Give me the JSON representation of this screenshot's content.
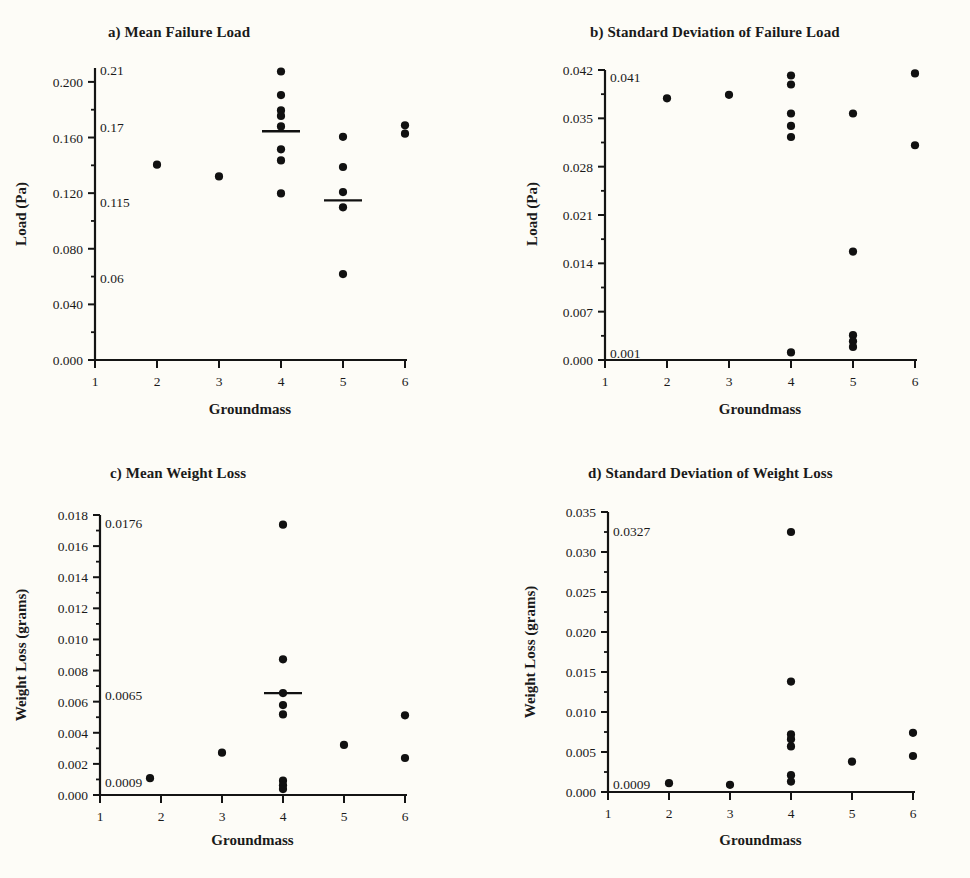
{
  "figure": {
    "background": "#fdfcf7",
    "ink": "#141414",
    "marker_color": "#111111"
  },
  "chart_data": [
    {
      "id": "panel-a",
      "type": "scatter",
      "title": "a) Mean Failure Load",
      "xlabel": "Groundmass",
      "ylabel": "Load (Pa)",
      "xlim": [
        1,
        6
      ],
      "ylim": [
        0.0,
        0.21
      ],
      "xticks": [
        1,
        2,
        3,
        4,
        5,
        6
      ],
      "xticklabels": [
        "1",
        "2",
        "3",
        "4",
        "5",
        "6"
      ],
      "yticks": [
        0.0,
        0.04,
        0.08,
        0.12,
        0.16,
        0.2
      ],
      "yticklabels": [
        "0.000",
        "0.040",
        "0.080",
        "0.120",
        "0.160",
        "0.200"
      ],
      "minor_yticks": [
        0.02,
        0.06,
        0.1,
        0.14,
        0.18
      ],
      "grid": false,
      "legend": "none",
      "annotations": [
        {
          "text": "0.21",
          "y": 0.2095
        },
        {
          "text": "0.17",
          "y": 0.168
        },
        {
          "text": "0.115",
          "y": 0.1145
        },
        {
          "text": "0.06",
          "y": 0.0595
        }
      ],
      "points": [
        {
          "x": 2,
          "y": 0.1405
        },
        {
          "x": 3,
          "y": 0.132
        },
        {
          "x": 4,
          "y": 0.2075
        },
        {
          "x": 4,
          "y": 0.1905
        },
        {
          "x": 4,
          "y": 0.1795
        },
        {
          "x": 4,
          "y": 0.1755
        },
        {
          "x": 4,
          "y": 0.168
        },
        {
          "x": 4,
          "y": 0.1515
        },
        {
          "x": 4,
          "y": 0.1435
        },
        {
          "x": 4,
          "y": 0.1198
        },
        {
          "x": 5,
          "y": 0.1605
        },
        {
          "x": 5,
          "y": 0.1388
        },
        {
          "x": 5,
          "y": 0.1208
        },
        {
          "x": 5,
          "y": 0.1098
        },
        {
          "x": 5,
          "y": 0.0618
        },
        {
          "x": 6,
          "y": 0.1688
        },
        {
          "x": 6,
          "y": 0.1628
        }
      ],
      "mean_lines": [
        {
          "x": 4,
          "y": 0.1645
        },
        {
          "x": 5,
          "y": 0.1148
        }
      ]
    },
    {
      "id": "panel-b",
      "type": "scatter",
      "title": "b) Standard Deviation of Failure Load",
      "xlabel": "Groundmass",
      "ylabel": "Load (Pa)",
      "xlim": [
        1,
        6
      ],
      "ylim": [
        0.0,
        0.042
      ],
      "xticks": [
        1,
        2,
        3,
        4,
        5,
        6
      ],
      "xticklabels": [
        "1",
        "2",
        "3",
        "4",
        "5",
        "6"
      ],
      "yticks": [
        0.0,
        0.007,
        0.014,
        0.021,
        0.028,
        0.035,
        0.042
      ],
      "yticklabels": [
        "0.000",
        "0.007",
        "0.014",
        "0.021",
        "0.028",
        "0.035",
        "0.042"
      ],
      "minor_yticks": [
        0.0035,
        0.0105,
        0.0175,
        0.0245,
        0.0315,
        0.0385
      ],
      "grid": false,
      "legend": "none",
      "annotations": [
        {
          "text": "0.041",
          "y": 0.0412
        },
        {
          "text": "0.001",
          "y": 0.0012
        }
      ],
      "points": [
        {
          "x": 2,
          "y": 0.0379
        },
        {
          "x": 3,
          "y": 0.0384
        },
        {
          "x": 4,
          "y": 0.0412
        },
        {
          "x": 4,
          "y": 0.0399
        },
        {
          "x": 4,
          "y": 0.0357
        },
        {
          "x": 4,
          "y": 0.0339
        },
        {
          "x": 4,
          "y": 0.0323
        },
        {
          "x": 4,
          "y": 0.0011
        },
        {
          "x": 5,
          "y": 0.0357
        },
        {
          "x": 5,
          "y": 0.0157
        },
        {
          "x": 5,
          "y": 0.0036
        },
        {
          "x": 5,
          "y": 0.0027
        },
        {
          "x": 5,
          "y": 0.0019
        },
        {
          "x": 6,
          "y": 0.0415
        },
        {
          "x": 6,
          "y": 0.0311
        }
      ],
      "mean_lines": []
    },
    {
      "id": "panel-c",
      "type": "scatter",
      "title": "c) Mean Weight Loss",
      "xlabel": "Groundmass",
      "ylabel": "Weight Loss (grams)",
      "xlim": [
        1,
        6
      ],
      "ylim": [
        0.0,
        0.018
      ],
      "xticks": [
        1,
        2,
        3,
        4,
        5,
        6
      ],
      "xticklabels": [
        "1",
        "2",
        "3",
        "4",
        "5",
        "6"
      ],
      "yticks": [
        0.0,
        0.002,
        0.004,
        0.006,
        0.008,
        0.01,
        0.012,
        0.014,
        0.016,
        0.018
      ],
      "yticklabels": [
        "0.000",
        "0.002",
        "0.004",
        "0.006",
        "0.008",
        "0.010",
        "0.012",
        "0.014",
        "0.016",
        "0.018"
      ],
      "minor_yticks": [
        0.001,
        0.003,
        0.005,
        0.007,
        0.009,
        0.011,
        0.013,
        0.015,
        0.017
      ],
      "grid": false,
      "legend": "none",
      "annotations": [
        {
          "text": "0.0176",
          "y": 0.01755
        },
        {
          "text": "0.0065",
          "y": 0.00648
        },
        {
          "text": "0.0009",
          "y": 0.00092
        }
      ],
      "points": [
        {
          "x": 1.82,
          "y": 0.00108
        },
        {
          "x": 3,
          "y": 0.00272
        },
        {
          "x": 4,
          "y": 0.01738
        },
        {
          "x": 4,
          "y": 0.00872
        },
        {
          "x": 4,
          "y": 0.00655
        },
        {
          "x": 4,
          "y": 0.00578
        },
        {
          "x": 4,
          "y": 0.00518
        },
        {
          "x": 4,
          "y": 0.00092
        },
        {
          "x": 4,
          "y": 0.00062
        },
        {
          "x": 4,
          "y": 0.00038
        },
        {
          "x": 5,
          "y": 0.00322
        },
        {
          "x": 6,
          "y": 0.00512
        },
        {
          "x": 6,
          "y": 0.00238
        }
      ],
      "mean_lines": [
        {
          "x": 4,
          "y": 0.00655
        }
      ]
    },
    {
      "id": "panel-d",
      "type": "scatter",
      "title": "d) Standard Deviation of Weight Loss",
      "xlabel": "Groundmass",
      "ylabel": "Weight Loss (grams)",
      "xlim": [
        1,
        6
      ],
      "ylim": [
        0.0,
        0.035
      ],
      "xticks": [
        1,
        2,
        3,
        4,
        5,
        6
      ],
      "xticklabels": [
        "1",
        "2",
        "3",
        "4",
        "5",
        "6"
      ],
      "yticks": [
        0.0,
        0.005,
        0.01,
        0.015,
        0.02,
        0.025,
        0.03,
        0.035
      ],
      "yticklabels": [
        "0.000",
        "0.005",
        "0.010",
        "0.015",
        "0.020",
        "0.025",
        "0.030",
        "0.035"
      ],
      "minor_yticks": [
        0.0025,
        0.0075,
        0.0125,
        0.0175,
        0.0225,
        0.0275,
        0.0325
      ],
      "grid": false,
      "legend": "none",
      "annotations": [
        {
          "text": "0.0327",
          "y": 0.0327
        },
        {
          "text": "0.0009",
          "y": 0.0011
        }
      ],
      "points": [
        {
          "x": 2,
          "y": 0.0011
        },
        {
          "x": 3,
          "y": 0.0009
        },
        {
          "x": 4,
          "y": 0.0325
        },
        {
          "x": 4,
          "y": 0.0138
        },
        {
          "x": 4,
          "y": 0.0072
        },
        {
          "x": 4,
          "y": 0.0066
        },
        {
          "x": 4,
          "y": 0.0057
        },
        {
          "x": 4,
          "y": 0.0021
        },
        {
          "x": 4,
          "y": 0.0013
        },
        {
          "x": 5,
          "y": 0.0038
        },
        {
          "x": 6,
          "y": 0.0074
        },
        {
          "x": 6,
          "y": 0.0045
        }
      ],
      "mean_lines": []
    }
  ]
}
